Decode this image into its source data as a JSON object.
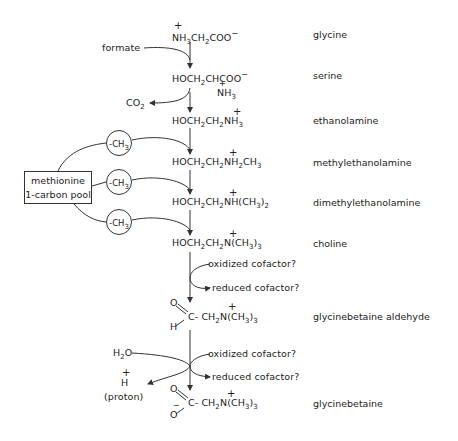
{
  "diagram": {
    "compounds": [
      {
        "id": "glycine",
        "formula": "NH3CH2COO−",
        "name": "glycine"
      },
      {
        "id": "serine",
        "formula": "HOCH2CHCOO− (NH3+)",
        "name": "serine"
      },
      {
        "id": "ethanolamine",
        "formula": "HOCH2CH2NH3+",
        "name": "ethanolamine"
      },
      {
        "id": "methylethanolamine",
        "formula": "HOCH2CH2NH2+CH3",
        "name": "methylethanolamine"
      },
      {
        "id": "dimethylethanolamine",
        "formula": "HOCH2CH2NH+(CH3)2",
        "name": "dimethylethanolamine"
      },
      {
        "id": "choline",
        "formula": "HOCH2CH2N+(CH3)3",
        "name": "choline"
      },
      {
        "id": "glycinebetaine-aldehyde",
        "formula": "O=C(H)−CH2N+(CH3)3",
        "name": "glycinebetaine aldehyde"
      },
      {
        "id": "glycinebetaine",
        "formula": "O=C(O−)−CH2N+(CH3)3",
        "name": "glycinebetaine"
      }
    ],
    "side_inputs": {
      "formate": "formate",
      "co2": "CO",
      "co2_sub": "2",
      "h2o_h": "H",
      "h2o_sub": "2",
      "h2o_o": "O",
      "proton_h": "H",
      "proton_label": "(proton)"
    },
    "cofactors": {
      "oxidized_1": "oxidized cofactor?",
      "reduced_1": "reduced cofactor?",
      "oxidized_2": "oxidized cofactor?",
      "reduced_2": "reduced cofactor?"
    },
    "methyl_pool": {
      "line1": "methionine",
      "line2": "1-carbon pool",
      "methyl_group": "-CH",
      "methyl_sub": "3"
    }
  }
}
